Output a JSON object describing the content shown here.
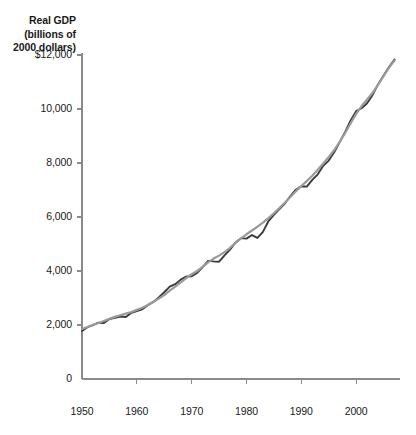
{
  "chart_data": {
    "type": "line",
    "title": "Real GDP\n(billions of\n2000 dollars)",
    "title_lines": [
      "Real GDP",
      "(billions of",
      "2000 dollars)"
    ],
    "xlabel": "",
    "ylabel": "Real GDP (billions of 2000 dollars)",
    "xlim": [
      1950,
      2008
    ],
    "ylim": [
      0,
      12000
    ],
    "grid": false,
    "legend": "none",
    "y_ticks": [
      {
        "value": 12000,
        "label": "$12,000"
      },
      {
        "value": 10000,
        "label": "10,000"
      },
      {
        "value": 8000,
        "label": "8,000"
      },
      {
        "value": 6000,
        "label": "6,000"
      },
      {
        "value": 4000,
        "label": "4,000"
      },
      {
        "value": 2000,
        "label": "2,000"
      },
      {
        "value": 0,
        "label": "0"
      }
    ],
    "x_ticks": [
      {
        "value": 1950,
        "label": "1950"
      },
      {
        "value": 1960,
        "label": "1960"
      },
      {
        "value": 1970,
        "label": "1970"
      },
      {
        "value": 1980,
        "label": "1980"
      },
      {
        "value": 1990,
        "label": "1990"
      },
      {
        "value": 2000,
        "label": "2000"
      }
    ],
    "colors": {
      "actual_line": "#3a3a3a",
      "potential_line": "#9a9a9a",
      "axis": "#8a8a8a",
      "text": "#1a1a1a"
    },
    "x": [
      1950,
      1951,
      1952,
      1953,
      1954,
      1955,
      1956,
      1957,
      1958,
      1959,
      1960,
      1961,
      1962,
      1963,
      1964,
      1965,
      1966,
      1967,
      1968,
      1969,
      1970,
      1971,
      1972,
      1973,
      1974,
      1975,
      1976,
      1977,
      1978,
      1979,
      1980,
      1981,
      1982,
      1983,
      1984,
      1985,
      1986,
      1987,
      1988,
      1989,
      1990,
      1991,
      1992,
      1993,
      1994,
      1995,
      1996,
      1997,
      1998,
      1999,
      2000,
      2001,
      2002,
      2003,
      2004,
      2005,
      2006,
      2007
    ],
    "series": [
      {
        "name": "Real GDP (actual)",
        "color": "#3a3a3a",
        "values": [
          1777,
          1920,
          1995,
          2086,
          2073,
          2222,
          2269,
          2315,
          2294,
          2455,
          2517,
          2580,
          2736,
          2855,
          3020,
          3214,
          3424,
          3510,
          3681,
          3796,
          3804,
          3930,
          4140,
          4377,
          4355,
          4344,
          4580,
          4790,
          5056,
          5216,
          5200,
          5332,
          5224,
          5448,
          5843,
          6082,
          6293,
          6501,
          6776,
          7010,
          7139,
          7126,
          7374,
          7581,
          7895,
          8090,
          8396,
          8775,
          9154,
          9575,
          9921,
          10029,
          10215,
          10521,
          10910,
          11243,
          11554,
          11830
        ]
      },
      {
        "name": "Potential real GDP",
        "color": "#9a9a9a",
        "values": [
          1850,
          1928,
          2010,
          2075,
          2150,
          2230,
          2300,
          2360,
          2420,
          2480,
          2560,
          2640,
          2740,
          2850,
          2975,
          3110,
          3270,
          3420,
          3580,
          3740,
          3880,
          4000,
          4150,
          4320,
          4460,
          4570,
          4700,
          4860,
          5040,
          5210,
          5360,
          5500,
          5640,
          5790,
          5960,
          6140,
          6330,
          6530,
          6740,
          6950,
          7150,
          7330,
          7530,
          7750,
          7980,
          8220,
          8480,
          8780,
          9110,
          9470,
          9820,
          10110,
          10350,
          10600,
          10900,
          11220,
          11530,
          11790
        ]
      }
    ]
  }
}
